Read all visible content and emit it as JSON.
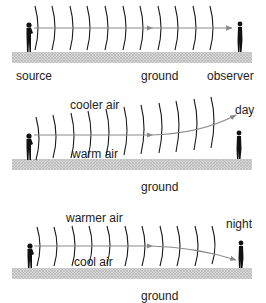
{
  "colors": {
    "wave": "#1a1a1a",
    "ray": "#8a8a8a",
    "ground": "#c8c8c8",
    "person": "#111111",
    "text": "#222222"
  },
  "panels": [
    {
      "id": "uniform",
      "labels": {
        "source": "source",
        "ground": "ground",
        "observer": "observer"
      }
    },
    {
      "id": "day",
      "labels": {
        "upper_air": "cooler air",
        "lower_air": "warm air",
        "time": "day",
        "ground": "ground"
      }
    },
    {
      "id": "night",
      "labels": {
        "upper_air": "warmer air",
        "lower_air": "cool air",
        "time": "night",
        "ground": "ground"
      }
    }
  ]
}
